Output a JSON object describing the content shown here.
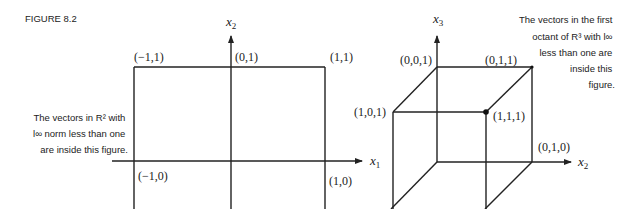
{
  "figure_label": "FIGURE 8.2",
  "left_panel": {
    "note_lines": [
      "The vectors in R² with",
      "l∞ norm less than one",
      "are inside this figure."
    ],
    "axis_labels": {
      "vertical": {
        "base": "x",
        "sub": "2"
      },
      "horizontal": {
        "base": "x",
        "sub": "1"
      }
    },
    "points": {
      "top_left": "(−1,1)",
      "top_mid": "(0,1)",
      "top_right": "(1,1)",
      "bottom_left": "(−1,0)",
      "bottom_right": "(1,0)"
    }
  },
  "right_panel": {
    "note_lines": [
      "The vectors in the first",
      "octant of R³ with l∞",
      "less than one are",
      "inside this",
      "figure."
    ],
    "axis_labels": {
      "vertical": {
        "base": "x",
        "sub": "3"
      },
      "horizontal": {
        "base": "x",
        "sub": "2"
      }
    },
    "points": {
      "p001": "(0,0,1)",
      "p011": "(0,1,1)",
      "p101": "(1,0,1)",
      "p111": "(1,1,1)",
      "p010": "(0,1,0)"
    }
  }
}
